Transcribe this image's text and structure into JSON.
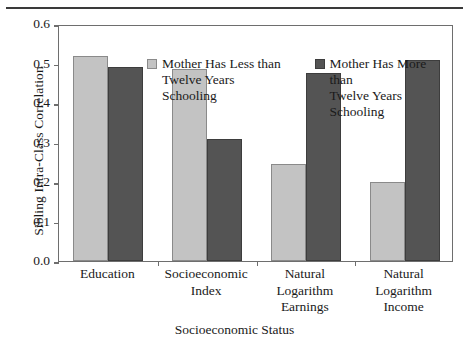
{
  "chart_data": {
    "type": "bar",
    "title": "",
    "xlabel": "Socioeconomic Status",
    "ylabel": "Sibling Intra-Class Correlation",
    "ylim": [
      0.0,
      0.6
    ],
    "yticks": [
      "0.0",
      "0.1",
      "0.2",
      "0.3",
      "0.4",
      "0.5",
      "0.6"
    ],
    "ytick_values": [
      0.0,
      0.1,
      0.2,
      0.3,
      0.4,
      0.5,
      0.6
    ],
    "grid": false,
    "legend_position": "top-center-inside",
    "categories": [
      "Education",
      "Socioeconomic\nIndex",
      "Natural\nLogarithm\nEarnings",
      "Natural\nLogarithm\nIncome"
    ],
    "series": [
      {
        "name": "Mother Has Less than\nTwelve Years Schooling",
        "color": "#c3c3c3",
        "values": [
          0.52,
          0.485,
          0.245,
          0.2
        ]
      },
      {
        "name": "Mother Has More than\nTwelve Years Schooling",
        "color": "#545454",
        "values": [
          0.49,
          0.31,
          0.475,
          0.51
        ]
      }
    ]
  },
  "legend": {
    "entries": [
      {
        "label": "Mother Has Less than\nTwelve Years Schooling",
        "swatch": "light-gray-swatch"
      },
      {
        "label": "Mother Has More than\nTwelve Years Schooling",
        "swatch": "dark-gray-swatch"
      }
    ]
  },
  "colors": {
    "series_light": "#c3c3c3",
    "series_dark": "#545454",
    "axis": "#6e6e6e",
    "text": "#1a1a1a",
    "rule": "#3a3a3a",
    "background": "#ffffff"
  }
}
